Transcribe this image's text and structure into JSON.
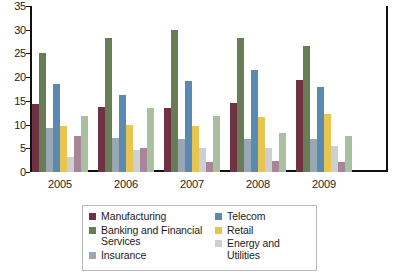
{
  "chart_data": {
    "type": "bar",
    "title": "",
    "subtitle": "",
    "xlabel": "",
    "ylabel": "",
    "ylim": [
      0,
      35
    ],
    "ytick_step": 5,
    "yticks": [
      "35",
      "30",
      "25",
      "20",
      "15",
      "10",
      "5",
      "0"
    ],
    "categories": [
      "2005",
      "2006",
      "2007",
      "2008",
      "2009"
    ],
    "grid": false,
    "legend_position": "bottom-center",
    "series": [
      {
        "name": "Manufacturing",
        "color": "#6e3243",
        "in_legend": true,
        "values": [
          14.4,
          13.8,
          13.4,
          14.6,
          19.5
        ]
      },
      {
        "name": "Banking and Financial Services",
        "color": "#687d55",
        "in_legend": true,
        "values": [
          25.1,
          28.3,
          30.0,
          28.3,
          26.5
        ]
      },
      {
        "name": "Insurance",
        "color": "#9aa7b5",
        "in_legend": true,
        "values": [
          9.3,
          7.2,
          7.0,
          7.0,
          7.0
        ]
      },
      {
        "name": "Telecom",
        "color": "#5b8ab0",
        "in_legend": true,
        "values": [
          18.5,
          16.3,
          19.2,
          21.5,
          18.0
        ]
      },
      {
        "name": "Retail",
        "color": "#e8c54e",
        "in_legend": true,
        "values": [
          9.6,
          10.0,
          9.8,
          11.7,
          12.3
        ]
      },
      {
        "name": "Energy and Utilities",
        "color": "#ccd0d2",
        "in_legend": true,
        "values": [
          3.2,
          4.6,
          5.1,
          5.1,
          5.5
        ]
      },
      {
        "name": "Series 7",
        "color": "#a88599",
        "in_legend": false,
        "values": [
          7.5,
          5.1,
          2.2,
          2.3,
          2.1
        ]
      },
      {
        "name": "Series 8",
        "color": "#a9c0a0",
        "in_legend": false,
        "values": [
          11.8,
          13.6,
          11.9,
          8.3,
          7.5
        ]
      }
    ]
  },
  "legend": {
    "left_column": [
      {
        "label": "Manufacturing",
        "color": "#6e3243"
      },
      {
        "label": "Banking and Financial Services",
        "color": "#687d55"
      },
      {
        "label": "Insurance",
        "color": "#9aa7b5"
      }
    ],
    "right_column": [
      {
        "label": "Telecom",
        "color": "#5b8ab0"
      },
      {
        "label": "Retail",
        "color": "#e8c54e"
      },
      {
        "label": "Energy and Utilities",
        "color": "#ccd0d2"
      }
    ]
  },
  "colors": {
    "axis": "#111111",
    "text": "#1c1c1c",
    "legend_border": "#b9b9b9",
    "background": "#ffffff"
  }
}
